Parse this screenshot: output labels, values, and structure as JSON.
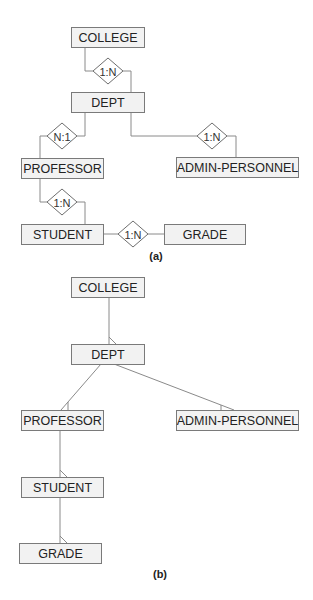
{
  "colors": {
    "entity_fill": "#f2f2f2",
    "entity_stroke": "#7a7a7a",
    "line": "#8a8a8a",
    "text": "#222222"
  },
  "diagram_a": {
    "caption": "(a)",
    "caption_pos": [
      156,
      256
    ],
    "entities": [
      {
        "id": "college",
        "label": "COLLEGE",
        "x": 71,
        "y": 27,
        "w": 73,
        "h": 20
      },
      {
        "id": "dept",
        "label": "DEPT",
        "x": 71,
        "y": 92,
        "w": 73,
        "h": 20
      },
      {
        "id": "professor",
        "label": "PROFESSOR",
        "x": 21,
        "y": 158,
        "w": 82,
        "h": 20
      },
      {
        "id": "admin-personnel",
        "label": "ADMIN-PERSONNEL",
        "x": 176,
        "y": 157,
        "w": 122,
        "h": 20
      },
      {
        "id": "student",
        "label": "STUDENT",
        "x": 21,
        "y": 224,
        "w": 82,
        "h": 20
      },
      {
        "id": "grade",
        "label": "GRADE",
        "x": 164,
        "y": 224,
        "w": 81,
        "h": 20
      }
    ],
    "relationships": [
      {
        "id": "college-dept",
        "label": "1:N",
        "cx": 108,
        "cy": 71,
        "rx": 15,
        "ry": 13,
        "path": "M85,47 V71 H93 M123,71 H131 V92"
      },
      {
        "id": "dept-professor",
        "label": "N:1",
        "cx": 62,
        "cy": 136,
        "rx": 15,
        "ry": 13,
        "path": "M85,112 V136 H77 M47,136 H40 V158"
      },
      {
        "id": "dept-admin",
        "label": "1:N",
        "cx": 212,
        "cy": 136,
        "rx": 15,
        "ry": 13,
        "path": "M131,112 V136 H197 M227,136 H236 V157"
      },
      {
        "id": "professor-student",
        "label": "1:N",
        "cx": 62,
        "cy": 202,
        "rx": 15,
        "ry": 13,
        "path": "M40,178 V202 H47 M77,202 H85 V224"
      },
      {
        "id": "student-grade",
        "label": "1:N",
        "cx": 133,
        "cy": 234,
        "rx": 15,
        "ry": 13,
        "path": "M103,234 H118 M148,234 H164"
      }
    ]
  },
  "diagram_b": {
    "caption": "(b)",
    "caption_pos": [
      160,
      574
    ],
    "entities": [
      {
        "id": "college",
        "label": "COLLEGE",
        "x": 71,
        "y": 277,
        "w": 73,
        "h": 20
      },
      {
        "id": "dept",
        "label": "DEPT",
        "x": 71,
        "y": 344,
        "w": 73,
        "h": 20
      },
      {
        "id": "professor",
        "label": "PROFESSOR",
        "x": 21,
        "y": 410,
        "w": 82,
        "h": 20
      },
      {
        "id": "admin-personnel",
        "label": "ADMIN-PERSONNEL",
        "x": 176,
        "y": 410,
        "w": 122,
        "h": 20
      },
      {
        "id": "student",
        "label": "STUDENT",
        "x": 21,
        "y": 477,
        "w": 82,
        "h": 20
      },
      {
        "id": "grade",
        "label": "GRADE",
        "x": 19,
        "y": 543,
        "w": 82,
        "h": 20
      }
    ],
    "links": [
      {
        "id": "college-dept",
        "path": "M109,297 L109,344",
        "foot": "M109,337 L116,344"
      },
      {
        "id": "dept-professor",
        "path": "M101,364 L61,410",
        "foot": "M68,402 L68,410"
      },
      {
        "id": "dept-admin",
        "path": "M114,364 L234,410",
        "foot": "M221,405 L221,410"
      },
      {
        "id": "professor-student",
        "path": "M60,430 L60,477",
        "foot": "M60,470 L67,477"
      },
      {
        "id": "student-grade",
        "path": "M60,497 L60,543",
        "foot": "M60,536 L67,543"
      }
    ]
  }
}
